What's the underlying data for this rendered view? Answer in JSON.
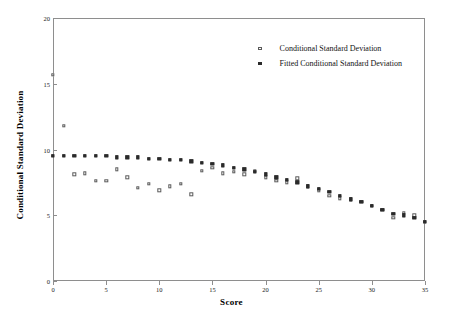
{
  "chart_data": {
    "type": "scatter",
    "title": "",
    "xlabel": "Score",
    "ylabel": "Conditional Standard Deviation",
    "xlim": [
      0,
      35
    ],
    "ylim": [
      0,
      20
    ],
    "xticks": [
      0,
      5,
      10,
      15,
      20,
      25,
      30,
      35
    ],
    "yticks": [
      0,
      5,
      10,
      15,
      20
    ],
    "grid": false,
    "legend_position": "top-right",
    "series": [
      {
        "name": "Conditional Standard Deviation",
        "marker": "open-square",
        "color": "#5a5a5a",
        "points": [
          [
            0.0,
            15.7
          ],
          [
            1.0,
            11.8
          ],
          [
            2.0,
            8.1
          ],
          [
            3.0,
            8.2
          ],
          [
            4.0,
            7.6
          ],
          [
            5.0,
            7.6
          ],
          [
            6.0,
            8.5
          ],
          [
            7.0,
            7.9
          ],
          [
            8.0,
            7.1
          ],
          [
            9.0,
            7.4
          ],
          [
            10.0,
            6.9
          ],
          [
            11.0,
            7.2
          ],
          [
            12.0,
            7.4
          ],
          [
            13.0,
            6.6
          ],
          [
            14.0,
            8.4
          ],
          [
            15.0,
            8.6
          ],
          [
            16.0,
            8.2
          ],
          [
            17.0,
            8.3
          ],
          [
            18.0,
            8.1
          ],
          [
            19.0,
            8.4
          ],
          [
            20.0,
            7.9
          ],
          [
            21.0,
            7.6
          ],
          [
            22.0,
            7.5
          ],
          [
            23.0,
            7.8
          ],
          [
            24.0,
            7.2
          ],
          [
            25.0,
            6.9
          ],
          [
            26.0,
            6.5
          ],
          [
            27.0,
            6.3
          ],
          [
            28.0,
            6.2
          ],
          [
            29.0,
            6.0
          ],
          [
            30.0,
            5.7
          ],
          [
            31.0,
            5.4
          ],
          [
            32.0,
            4.8
          ],
          [
            33.0,
            5.2
          ],
          [
            34.0,
            5.0
          ],
          [
            35.0,
            4.5
          ]
        ]
      },
      {
        "name": "Fitted Conditional Standard Deviation",
        "marker": "filled-square",
        "color": "#2b2b2b",
        "points": [
          [
            0.0,
            9.5
          ],
          [
            1.0,
            9.5
          ],
          [
            2.0,
            9.5
          ],
          [
            3.0,
            9.5
          ],
          [
            4.0,
            9.5
          ],
          [
            5.0,
            9.5
          ],
          [
            6.0,
            9.4
          ],
          [
            7.0,
            9.4
          ],
          [
            8.0,
            9.4
          ],
          [
            9.0,
            9.3
          ],
          [
            10.0,
            9.3
          ],
          [
            11.0,
            9.2
          ],
          [
            12.0,
            9.2
          ],
          [
            13.0,
            9.1
          ],
          [
            14.0,
            9.0
          ],
          [
            15.0,
            8.9
          ],
          [
            16.0,
            8.8
          ],
          [
            17.0,
            8.6
          ],
          [
            18.0,
            8.5
          ],
          [
            19.0,
            8.3
          ],
          [
            20.0,
            8.1
          ],
          [
            21.0,
            7.9
          ],
          [
            22.0,
            7.7
          ],
          [
            23.0,
            7.5
          ],
          [
            24.0,
            7.2
          ],
          [
            25.0,
            7.0
          ],
          [
            26.0,
            6.8
          ],
          [
            27.0,
            6.5
          ],
          [
            28.0,
            6.2
          ],
          [
            29.0,
            6.0
          ],
          [
            30.0,
            5.7
          ],
          [
            31.0,
            5.4
          ],
          [
            32.0,
            5.1
          ],
          [
            33.0,
            5.0
          ],
          [
            34.0,
            4.8
          ],
          [
            35.0,
            4.5
          ]
        ]
      }
    ]
  },
  "axes": {
    "xlabel": "Score",
    "ylabel": "Conditional Standard Deviation",
    "xtick_labels": [
      "0",
      "5",
      "10",
      "15",
      "20",
      "25",
      "30",
      "35"
    ],
    "ytick_labels": [
      "0",
      "5",
      "10",
      "15",
      "20"
    ]
  },
  "legend": {
    "entries": [
      {
        "label": "Conditional Standard Deviation",
        "marker": "open-square"
      },
      {
        "label": "Fitted Conditional Standard Deviation",
        "marker": "filled-square"
      }
    ]
  },
  "colors": {
    "axis": "#8e8e8e",
    "open_marker": "#5a5a5a",
    "filled_marker": "#2b2b2b",
    "text": "#121212",
    "background": "#ffffff"
  }
}
